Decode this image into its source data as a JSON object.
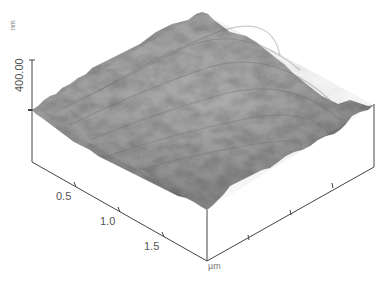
{
  "figure": {
    "type": "AFM 3D surface topography",
    "z_axis": {
      "tick_label": "400.00",
      "unit": "nm"
    },
    "x_axis": {
      "tick_labels": [
        "0.5",
        "1.0",
        "1.5"
      ],
      "unit": "µm"
    },
    "colors": {
      "axis": "#444444",
      "surface_light": "#c8c8c8",
      "surface_mid": "#8c8c8c",
      "surface_dark": "#555555",
      "label": "#555555"
    }
  }
}
